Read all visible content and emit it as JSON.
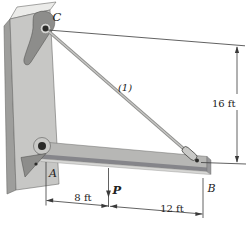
{
  "figure": {
    "labels": {
      "point_c": "C",
      "point_a": "A",
      "point_b": "B",
      "member": "(1)",
      "force": "P"
    },
    "dimensions": {
      "height": "16 ft",
      "span_left": "8 ft",
      "span_right": "12 ft"
    },
    "colors": {
      "background": "#ffffff",
      "column_front": "#c7c7c5",
      "column_side": "#9e9e9c",
      "column_top": "#ebebe9",
      "beam_front": "#b7b7b5",
      "beam_shadow": "#85858a",
      "beam_bottom": "#d6d6d4",
      "beam_end": "#98989a",
      "gusset": "#8d8d8b",
      "boss": "#c9c9c7",
      "pin": "#2b2b29",
      "cable_edge": "#8f8f8d",
      "cable_center": "#c6c6c4",
      "line": "#3a3a3a",
      "text": "#222222",
      "outline": "#6b6b69"
    }
  }
}
